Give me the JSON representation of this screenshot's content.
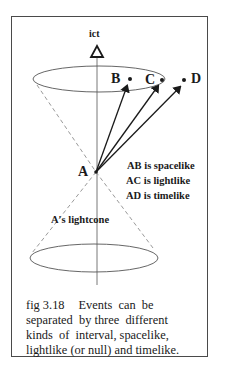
{
  "figure": {
    "axis_label": "ict",
    "events": {
      "A": "A",
      "B": "B",
      "C": "C",
      "D": "D"
    },
    "statements": [
      "AB is spacelike",
      "AC is lightlike",
      "AD is timelike"
    ],
    "cone_label": "A's lightcone",
    "caption": {
      "fig_number": "fig 3.18",
      "lines": [
        "Events  can  be",
        "separated  by three  different",
        "kinds  of  interval, spacelike,",
        "lightlike (or null) and timelike."
      ]
    },
    "colors": {
      "ink": "#1a1a1a",
      "frame": "#4a4a4a",
      "ellipse": "#555555",
      "dashed": "#9a9a9a",
      "background": "#ffffff"
    }
  }
}
